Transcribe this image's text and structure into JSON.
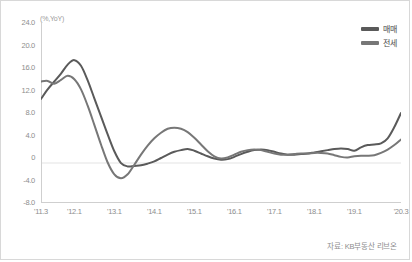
{
  "axis_unit": "(%,YoY)",
  "source_note": "자료: KB부동산 리브온",
  "legend": {
    "items": [
      {
        "label": "매매",
        "color": "#5a5a5a"
      },
      {
        "label": "전세",
        "color": "#777777"
      }
    ]
  },
  "chart_data": {
    "type": "line",
    "title": "",
    "subtitle": "",
    "xlabel": "",
    "ylabel": "(%,YoY)",
    "ylim": [
      -8.0,
      24.0
    ],
    "yticks": [
      24.0,
      20.0,
      16.0,
      12.0,
      8.0,
      4.0,
      0,
      -4.0,
      -8.0
    ],
    "ytick_labels": [
      "24.0",
      "20.0",
      "16.0",
      "12.0",
      "8.0",
      "4.0",
      "0",
      "-4.0",
      "-8.0"
    ],
    "xtick_labels": [
      "'11.3",
      "'12.1",
      "'13.1",
      "'14.1",
      "'15.1",
      "'16.1",
      "'17.1",
      "'18.1",
      "'19.1",
      "'20.3"
    ],
    "xtick_positions": [
      0,
      10,
      22,
      34,
      46,
      58,
      70,
      82,
      94,
      108
    ],
    "x_index_range": [
      0,
      108
    ],
    "grid": false,
    "zero_line": true,
    "legend_position": "top-right",
    "series": [
      {
        "name": "매매",
        "color": "#5a5a5a",
        "x": [
          0,
          2,
          4,
          6,
          8,
          10,
          12,
          14,
          16,
          18,
          20,
          22,
          24,
          26,
          28,
          30,
          32,
          34,
          36,
          38,
          40,
          42,
          44,
          46,
          48,
          50,
          52,
          54,
          56,
          58,
          60,
          62,
          64,
          66,
          68,
          70,
          72,
          74,
          76,
          78,
          80,
          82,
          84,
          86,
          88,
          90,
          92,
          94,
          96,
          98,
          100,
          102,
          104,
          106,
          108
        ],
        "values": [
          10.5,
          12.2,
          13.6,
          15.0,
          16.6,
          17.4,
          16.4,
          13.8,
          10.6,
          7.4,
          4.2,
          1.2,
          -0.9,
          -1.5,
          -1.4,
          -1.3,
          -1.0,
          -0.6,
          0.0,
          0.6,
          1.1,
          1.4,
          1.6,
          1.3,
          0.8,
          0.3,
          -0.1,
          -0.3,
          -0.2,
          0.2,
          0.7,
          1.1,
          1.4,
          1.5,
          1.4,
          1.1,
          0.8,
          0.6,
          0.6,
          0.7,
          0.8,
          1.0,
          1.2,
          1.4,
          1.6,
          1.7,
          1.6,
          1.3,
          1.9,
          2.3,
          2.4,
          2.6,
          3.5,
          5.5,
          8.0
        ]
      },
      {
        "name": "전세",
        "color": "#777777",
        "x": [
          0,
          2,
          4,
          6,
          8,
          10,
          12,
          14,
          16,
          18,
          20,
          22,
          24,
          26,
          28,
          30,
          32,
          34,
          36,
          38,
          40,
          42,
          44,
          46,
          48,
          50,
          52,
          54,
          56,
          58,
          60,
          62,
          64,
          66,
          68,
          70,
          72,
          74,
          76,
          78,
          80,
          82,
          84,
          86,
          88,
          90,
          92,
          94,
          96,
          98,
          100,
          102,
          104,
          106,
          108
        ],
        "values": [
          13.6,
          13.7,
          13.2,
          13.9,
          14.6,
          14.0,
          12.2,
          9.3,
          5.9,
          2.4,
          -0.8,
          -2.9,
          -3.6,
          -2.9,
          -1.2,
          0.6,
          2.2,
          3.5,
          4.5,
          5.2,
          5.4,
          5.2,
          4.6,
          3.6,
          2.4,
          1.2,
          0.3,
          -0.1,
          0.1,
          0.6,
          1.1,
          1.4,
          1.5,
          1.4,
          1.1,
          0.8,
          0.6,
          0.6,
          0.7,
          0.8,
          0.8,
          0.9,
          0.9,
          0.8,
          0.5,
          0.2,
          0.1,
          0.3,
          0.4,
          0.4,
          0.5,
          0.9,
          1.5,
          2.3,
          3.3
        ]
      }
    ]
  }
}
